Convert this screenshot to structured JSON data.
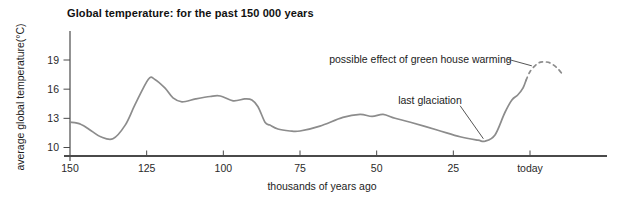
{
  "chart_data": {
    "type": "line",
    "title": "Global temperature: for the past 150 000 years",
    "xlabel": "thousands of years ago",
    "ylabel": "average global temperature(°C)",
    "x_axis": {
      "ticks": [
        150,
        125,
        100,
        75,
        50,
        25,
        0
      ],
      "tick_labels": [
        "150",
        "125",
        "100",
        "75",
        "50",
        "25",
        "today"
      ],
      "range": [
        150,
        -25
      ],
      "unit": "thousands of years ago"
    },
    "y_axis": {
      "ticks": [
        19,
        16,
        13,
        10
      ],
      "tick_labels": [
        "19",
        "16",
        "13",
        "10"
      ],
      "range_visible": [
        9.1,
        21.8
      ],
      "unit": "°C"
    },
    "series": [
      {
        "name": "average global temperature",
        "style": "solid",
        "points": [
          [
            150,
            12.6
          ],
          [
            146.5,
            12.4
          ],
          [
            143,
            11.7
          ],
          [
            140,
            11.1
          ],
          [
            136,
            10.9
          ],
          [
            132,
            12.3
          ],
          [
            128.8,
            14.4
          ],
          [
            124.5,
            17.0
          ],
          [
            122.3,
            17.0
          ],
          [
            119,
            16.1
          ],
          [
            116.4,
            15.1
          ],
          [
            113.5,
            14.7
          ],
          [
            109,
            15.0
          ],
          [
            104.3,
            15.25
          ],
          [
            101,
            15.3
          ],
          [
            96.8,
            14.8
          ],
          [
            93,
            15.0
          ],
          [
            90.7,
            14.9
          ],
          [
            88.7,
            14.2
          ],
          [
            86.4,
            12.6
          ],
          [
            84.8,
            12.3
          ],
          [
            82.2,
            11.9
          ],
          [
            78.3,
            11.7
          ],
          [
            75,
            11.7
          ],
          [
            68.5,
            12.2
          ],
          [
            61,
            13.1
          ],
          [
            55.4,
            13.4
          ],
          [
            51.5,
            13.2
          ],
          [
            47.9,
            13.4
          ],
          [
            44,
            13.0
          ],
          [
            39,
            12.6
          ],
          [
            30.3,
            11.8
          ],
          [
            22.8,
            11.1
          ],
          [
            17,
            10.75
          ],
          [
            14.7,
            10.65
          ],
          [
            11.4,
            11.3
          ],
          [
            8.2,
            13.6
          ],
          [
            5.9,
            14.9
          ],
          [
            4,
            15.4
          ],
          [
            2.3,
            16.1
          ],
          [
            1.3,
            16.9
          ]
        ]
      },
      {
        "name": "possible effect of green house warming (projection, beyond today)",
        "style": "dashed",
        "points": [
          [
            1.3,
            16.9
          ],
          [
            0,
            17.8
          ],
          [
            -2.3,
            18.6
          ],
          [
            -4.2,
            18.8
          ],
          [
            -6.5,
            18.7
          ],
          [
            -8.8,
            18.2
          ],
          [
            -10.4,
            17.6
          ]
        ]
      }
    ],
    "annotations": [
      {
        "label": "last glaciation",
        "text_pos": [
          43,
          14.8
        ],
        "line": [
          [
            22.8,
            14.3
          ],
          [
            15.2,
            10.9
          ]
        ]
      },
      {
        "label": "possible effect of green house warming",
        "text_pos": [
          65.5,
          19.1
        ],
        "line": [
          [
            7.5,
            19.1
          ],
          [
            -0.6,
            18.4
          ]
        ]
      }
    ],
    "colors": {
      "curve": "#8c8c8c",
      "axis": "#4a4a4a",
      "text": "#1c1c1c"
    },
    "legend": "none",
    "grid": false
  }
}
